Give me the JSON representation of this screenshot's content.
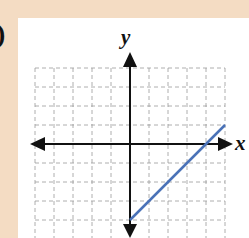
{
  "figure": {
    "label_fragment": ")",
    "background_color": "#F4DCC3",
    "panel_color": "#FFFFFF"
  },
  "chart_data": {
    "type": "line",
    "title": "",
    "xlabel": "x",
    "ylabel": "y",
    "xlim": [
      -5,
      5
    ],
    "ylim": [
      -5,
      4
    ],
    "grid": true,
    "grid_style": "dashed",
    "tick_labels": false,
    "series": [
      {
        "name": "line",
        "color": "#4A72B8",
        "equation": "y = x - 4",
        "points": [
          [
            0,
            -4
          ],
          [
            5,
            1
          ]
        ]
      }
    ]
  }
}
